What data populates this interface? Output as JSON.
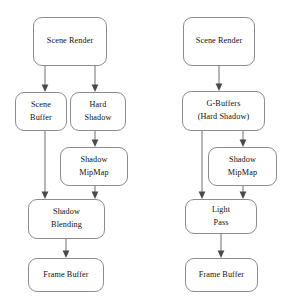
{
  "diagram": {
    "background_color": "#ffffff",
    "node_border_color": "#8d8d8d",
    "edge_color": "#6f6f6f",
    "text_color": "#111111",
    "pipelines": [
      {
        "id": "forward-pipeline",
        "name": "Forward shading shadow pipeline",
        "nodes": [
          {
            "id": "l-scene-render",
            "label": "Scene Render",
            "label2": ""
          },
          {
            "id": "l-scene-buffer",
            "label": "Scene",
            "label2": "Buffer"
          },
          {
            "id": "l-hard-shadow",
            "label": "Hard",
            "label2": "Shadow"
          },
          {
            "id": "l-shadow-mipmap",
            "label": "Shadow",
            "label2": "MipMap"
          },
          {
            "id": "l-shadow-blending",
            "label": "Shadow",
            "label2": "Blending"
          },
          {
            "id": "l-frame-buffer",
            "label": "Frame Buffer",
            "label2": ""
          }
        ],
        "edges": [
          {
            "from": "l-scene-render",
            "to": "l-scene-buffer"
          },
          {
            "from": "l-scene-render",
            "to": "l-hard-shadow"
          },
          {
            "from": "l-hard-shadow",
            "to": "l-shadow-mipmap"
          },
          {
            "from": "l-scene-buffer",
            "to": "l-shadow-blending"
          },
          {
            "from": "l-shadow-mipmap",
            "to": "l-shadow-blending"
          },
          {
            "from": "l-shadow-blending",
            "to": "l-frame-buffer"
          }
        ]
      },
      {
        "id": "deferred-pipeline",
        "name": "Deferred shading shadow pipeline",
        "nodes": [
          {
            "id": "r-scene-render",
            "label": "Scene Render",
            "label2": ""
          },
          {
            "id": "r-g-buffers",
            "label": "G-Buffers",
            "label2": "(Hard Shadow)"
          },
          {
            "id": "r-shadow-mipmap",
            "label": "Shadow",
            "label2": "MipMap"
          },
          {
            "id": "r-light-pass",
            "label": "Light",
            "label2": "Pass"
          },
          {
            "id": "r-frame-buffer",
            "label": "Frame Buffer",
            "label2": ""
          }
        ],
        "edges": [
          {
            "from": "r-scene-render",
            "to": "r-g-buffers"
          },
          {
            "from": "r-g-buffers",
            "to": "r-shadow-mipmap"
          },
          {
            "from": "r-g-buffers",
            "to": "r-light-pass"
          },
          {
            "from": "r-shadow-mipmap",
            "to": "r-light-pass"
          },
          {
            "from": "r-light-pass",
            "to": "r-frame-buffer"
          }
        ]
      }
    ]
  }
}
